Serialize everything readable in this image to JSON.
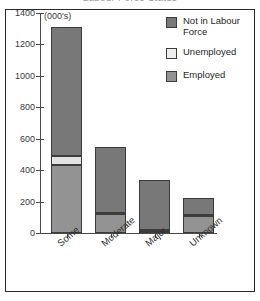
{
  "title": "Labour Force Status",
  "axis": {
    "units_note": "(000's)",
    "y_ticks": [
      "0",
      "200",
      "400",
      "600",
      "800",
      "1000",
      "1200",
      "1400"
    ]
  },
  "legend": {
    "items": [
      {
        "label": "Not in Labour Force",
        "color": "#787878",
        "key": "nilf"
      },
      {
        "label": "Unemployed",
        "color": "#eeeeee",
        "key": "unemp"
      },
      {
        "label": "Employed",
        "color": "#939393",
        "key": "emp"
      }
    ]
  },
  "chart_data": {
    "type": "bar",
    "title": "Labour Force Status",
    "xlabel": "",
    "ylabel": "(000's)",
    "ylim": [
      0,
      1400
    ],
    "ytick_step": 200,
    "grid": false,
    "stacked": true,
    "legend_position": "top-right",
    "categories": [
      "Some",
      "Moderate",
      "Major",
      "Unknown"
    ],
    "series": [
      {
        "name": "Employed",
        "color": "#939393",
        "values": [
          430,
          120,
          10,
          110
        ]
      },
      {
        "name": "Unemployed",
        "color": "#eeeeee",
        "values": [
          60,
          10,
          8,
          6
        ]
      },
      {
        "name": "Not in Labour Force",
        "color": "#787878",
        "values": [
          820,
          420,
          322,
          109
        ]
      }
    ],
    "totals": [
      1310,
      550,
      340,
      225
    ]
  }
}
